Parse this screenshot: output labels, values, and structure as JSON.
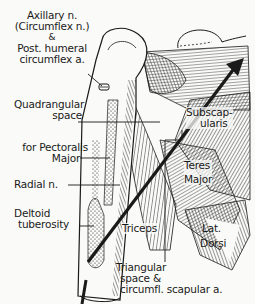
{
  "diagram": {
    "colors": {
      "ink": "#1a1a1a",
      "paper": "#fafaf8"
    },
    "labels": {
      "axillary_nerve": {
        "line1": "Axillary n.",
        "line2": "(Circumflex n.)",
        "line3": "&",
        "line4": "Post. humeral",
        "line5": "circumflex a."
      },
      "quadrangular_space": {
        "line1": "Quadrangular",
        "line2": "space"
      },
      "pectoralis_major": {
        "line1": "for Pectoralis",
        "line2": "Major"
      },
      "radial_nerve": {
        "line1": "Radial n."
      },
      "deltoid_tuberosity": {
        "line1": "Deltoid",
        "line2": "tuberosity"
      },
      "subscapularis": {
        "line1": "Subscap-",
        "line2": "ularis"
      },
      "teres_major": {
        "line1": "Teres",
        "line2": "Major"
      },
      "triceps": {
        "line1": "Triceps"
      },
      "lat_dorsi": {
        "line1": "Lat.",
        "line2": "Dorsi"
      },
      "triangular_space": {
        "line1": "Triangular",
        "line2": "space &",
        "line3": "circumfl. scapular a."
      }
    }
  }
}
